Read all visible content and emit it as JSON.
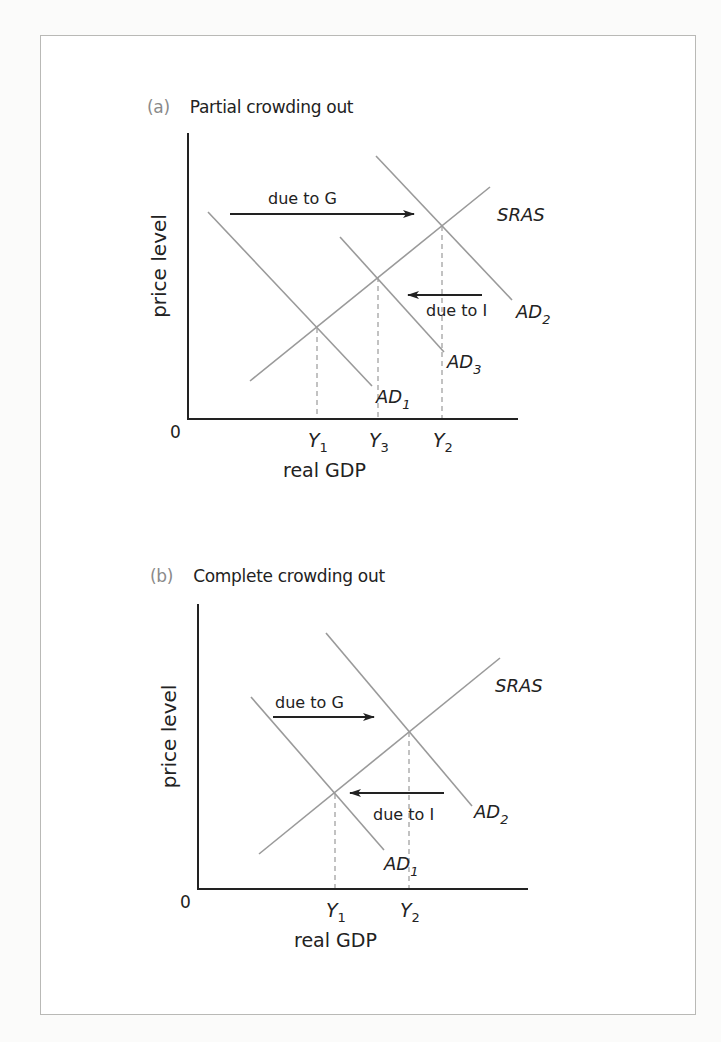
{
  "figure": {
    "panels": [
      {
        "id": "a",
        "letter": "(a)",
        "title": "Partial crowding out",
        "y_axis_label": "price level",
        "x_axis_label": "real GDP",
        "origin_label": "0",
        "x_ticks": [
          {
            "base": "Y",
            "sub": "1",
            "x": 317
          },
          {
            "base": "Y",
            "sub": "3",
            "x": 378
          },
          {
            "base": "Y",
            "sub": "2",
            "x": 442
          }
        ],
        "curves": [
          {
            "name": "SRAS",
            "label_base": "SRAS",
            "label_sub": "",
            "x1": 250,
            "y1": 381,
            "x2": 490,
            "y2": 187,
            "lx": 497,
            "ly": 221
          },
          {
            "name": "AD1",
            "label_base": "AD",
            "label_sub": "1",
            "x1": 208,
            "y1": 212,
            "x2": 372,
            "y2": 386,
            "lx": 376,
            "ly": 403
          },
          {
            "name": "AD2",
            "label_base": "AD",
            "label_sub": "2",
            "x1": 376,
            "y1": 156,
            "x2": 512,
            "y2": 300,
            "lx": 516,
            "ly": 318
          },
          {
            "name": "AD3",
            "label_base": "AD",
            "label_sub": "3",
            "x1": 340,
            "y1": 237,
            "x2": 444,
            "y2": 352,
            "lx": 447,
            "ly": 368
          }
        ],
        "equilibria": [
          {
            "x": 317,
            "y": 328
          },
          {
            "x": 378,
            "y": 277
          },
          {
            "x": 442,
            "y": 226
          }
        ],
        "arrows": [
          {
            "label": "due to G",
            "direction": "right",
            "x_from": 230,
            "x_to": 414,
            "y": 214,
            "lx": 268,
            "ly": 204
          },
          {
            "label": "due to I",
            "direction": "left",
            "x_from": 482,
            "x_to": 408,
            "y": 295,
            "lx": 426,
            "ly": 316
          }
        ],
        "axis": {
          "x0": 188,
          "y_top": 133,
          "y0": 419,
          "x_end": 518
        },
        "title_pos": {
          "x": 147,
          "y": 115
        }
      },
      {
        "id": "b",
        "letter": "(b)",
        "title": "Complete crowding out",
        "y_axis_label": "price level",
        "x_axis_label": "real GDP",
        "origin_label": "0",
        "x_ticks": [
          {
            "base": "Y",
            "sub": "1",
            "x": 335
          },
          {
            "base": "Y",
            "sub": "2",
            "x": 409
          }
        ],
        "curves": [
          {
            "name": "SRAS",
            "label_base": "SRAS",
            "label_sub": "",
            "x1": 259,
            "y1": 854,
            "x2": 500,
            "y2": 658,
            "lx": 495,
            "ly": 692
          },
          {
            "name": "AD1",
            "label_base": "AD",
            "label_sub": "1",
            "x1": 251,
            "y1": 697,
            "x2": 384,
            "y2": 850,
            "lx": 384,
            "ly": 870
          },
          {
            "name": "AD2",
            "label_base": "AD",
            "label_sub": "2",
            "x1": 326,
            "y1": 633,
            "x2": 472,
            "y2": 806,
            "lx": 474,
            "ly": 818
          }
        ],
        "equilibria": [
          {
            "x": 335,
            "y": 794
          },
          {
            "x": 409,
            "y": 732
          }
        ],
        "arrows": [
          {
            "label": "due to G",
            "direction": "right",
            "x_from": 273,
            "x_to": 374,
            "y": 717,
            "lx": 275,
            "ly": 708
          },
          {
            "label": "due to I",
            "direction": "left",
            "x_from": 444,
            "x_to": 350,
            "y": 793,
            "lx": 373,
            "ly": 820
          }
        ],
        "axis": {
          "x0": 198,
          "y_top": 604,
          "y0": 889,
          "x_end": 528
        },
        "title_pos": {
          "x": 150,
          "y": 584
        }
      }
    ]
  },
  "colors": {
    "curve": "#9a9a9a",
    "axis": "#222222",
    "arrow": "#222222",
    "dashed": "#9a9a9a",
    "panel_letter": "#8a8a8a"
  }
}
